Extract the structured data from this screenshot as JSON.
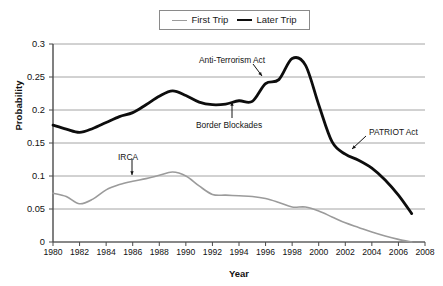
{
  "chart_data": {
    "type": "line",
    "title": "",
    "xlabel": "Year",
    "ylabel": "Probability",
    "xlim": [
      1980,
      2008
    ],
    "ylim": [
      0,
      0.3
    ],
    "grid": "horizontal",
    "legend_position": "top-center",
    "ytick_labels": [
      "0.3",
      "0.25",
      "0.2",
      "0.15",
      "0.1",
      "0.05",
      "0"
    ],
    "ytick_values": [
      0.3,
      0.25,
      0.2,
      0.15,
      0.1,
      0.05,
      0
    ],
    "xtick_labels": [
      "1980",
      "1982",
      "1984",
      "1986",
      "1988",
      "1990",
      "1992",
      "1994",
      "1996",
      "1998",
      "2000",
      "2002",
      "2004",
      "2006",
      "2008"
    ],
    "xtick_values": [
      1980,
      1982,
      1984,
      1986,
      1988,
      1990,
      1992,
      1994,
      1996,
      1998,
      2000,
      2002,
      2004,
      2006,
      2008
    ],
    "x": [
      1980,
      1981,
      1982,
      1983,
      1984,
      1985,
      1986,
      1987,
      1988,
      1989,
      1990,
      1991,
      1992,
      1993,
      1994,
      1995,
      1996,
      1997,
      1998,
      1999,
      2000,
      2001,
      2002,
      2003,
      2004,
      2005,
      2006,
      2007
    ],
    "series": [
      {
        "name": "First Trip",
        "color": "#9b9b9b",
        "width": 1.6,
        "values": [
          0.074,
          0.069,
          0.058,
          0.065,
          0.079,
          0.087,
          0.092,
          0.096,
          0.101,
          0.106,
          0.1,
          0.085,
          0.072,
          0.071,
          0.07,
          0.069,
          0.066,
          0.06,
          0.053,
          0.053,
          0.047,
          0.038,
          0.029,
          0.022,
          0.015,
          0.009,
          0.004,
          0.0
        ]
      },
      {
        "name": "Later Trip",
        "color": "#0d0d0d",
        "width": 2.8,
        "values": [
          0.177,
          0.171,
          0.166,
          0.172,
          0.181,
          0.19,
          0.196,
          0.208,
          0.221,
          0.229,
          0.222,
          0.212,
          0.208,
          0.209,
          0.214,
          0.213,
          0.24,
          0.246,
          0.278,
          0.268,
          0.208,
          0.152,
          0.133,
          0.124,
          0.112,
          0.094,
          0.071,
          0.043
        ]
      }
    ],
    "annotations": [
      {
        "label": "Anti-Terrorism Act",
        "text_x": 199,
        "text_y": 56,
        "arrow": {
          "x1": 253,
          "y1": 64,
          "x2": 262,
          "y2": 76
        }
      },
      {
        "label": "Border Blockades",
        "text_x": 196,
        "text_y": 121,
        "arrow": {
          "x1": 232,
          "y1": 118,
          "x2": 232,
          "y2": 102
        }
      },
      {
        "label": "PATRIOT Act",
        "text_x": 369,
        "text_y": 128,
        "arrow": {
          "x1": 366,
          "y1": 136,
          "x2": 352,
          "y2": 149
        }
      },
      {
        "label": "IRCA",
        "text_x": 118,
        "text_y": 153,
        "arrow": {
          "x1": 132,
          "y1": 159,
          "x2": 132,
          "y2": 175
        }
      }
    ]
  },
  "legend": {
    "entries": [
      {
        "label": "First Trip"
      },
      {
        "label": "Later Trip"
      }
    ]
  },
  "axes": {
    "ylabel": "Probability",
    "xlabel": "Year"
  }
}
